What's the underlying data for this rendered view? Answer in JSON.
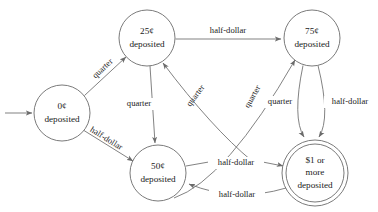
{
  "diagram": {
    "type": "finite-state-machine",
    "accent_color": "#6b6b6b",
    "text_color": "#1a1a1a",
    "background_color": "#ffffff",
    "states": [
      {
        "id": "s0",
        "line1": "0¢",
        "line2": "deposited",
        "cx": 62,
        "cy": 113,
        "r": 28,
        "accepting": false,
        "start": true
      },
      {
        "id": "s25",
        "line1": "25¢",
        "line2": "deposited",
        "cx": 147,
        "cy": 38,
        "r": 28,
        "accepting": false,
        "start": false
      },
      {
        "id": "s75",
        "line1": "75¢",
        "line2": "deposited",
        "cx": 312,
        "cy": 38,
        "r": 28,
        "accepting": false,
        "start": false
      },
      {
        "id": "s50",
        "line1": "50¢",
        "line2": "deposited",
        "cx": 158,
        "cy": 173,
        "r": 28,
        "accepting": false,
        "start": false
      },
      {
        "id": "s1",
        "line1": "$1 or",
        "line2": "more",
        "line3": "deposited",
        "cx": 315,
        "cy": 173,
        "r": 29,
        "r_outer": 33,
        "accepting": true,
        "start": false
      }
    ],
    "transitions": [
      {
        "id": "t_start",
        "from": "",
        "to": "s0",
        "label": ""
      },
      {
        "id": "t_0_25",
        "from": "s0",
        "to": "s25",
        "label": "quarter"
      },
      {
        "id": "t_0_50",
        "from": "s0",
        "to": "s50",
        "label": "half-dollar"
      },
      {
        "id": "t_25_75",
        "from": "s25",
        "to": "s75",
        "label": "half-dollar"
      },
      {
        "id": "t_25_50",
        "from": "s25",
        "to": "s50",
        "label": "quarter"
      },
      {
        "id": "t_50_25",
        "from": "s50",
        "to": "s25",
        "label": "quarter"
      },
      {
        "id": "t_50_75",
        "from": "s50",
        "to": "s75",
        "label": "quarter"
      },
      {
        "id": "t_75_1_q",
        "from": "s75",
        "to": "s1",
        "label": "quarter"
      },
      {
        "id": "t_75_1_h",
        "from": "s75",
        "to": "s1",
        "label": "half-dollar"
      },
      {
        "id": "t_50_1",
        "from": "s50",
        "to": "s1",
        "label": "half-dollar"
      },
      {
        "id": "t_1_50",
        "from": "s1",
        "to": "s50",
        "label": "half-dollar"
      }
    ]
  }
}
